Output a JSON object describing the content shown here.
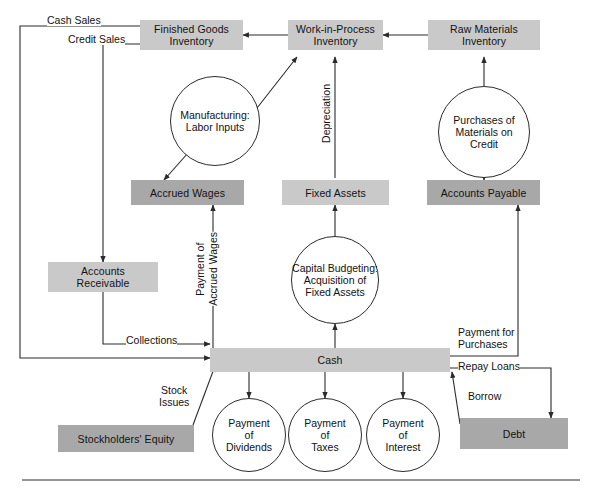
{
  "diagram": {
    "colors": {
      "asset_fill": "#c9c9c9",
      "liability_fill": "#a8a8a8",
      "line": "#2b2b2b",
      "background": "#ffffff"
    },
    "boxes": [
      {
        "id": "finished-goods-inventory",
        "label": "Finished Goods\nInventory",
        "shade": "light"
      },
      {
        "id": "work-in-process-inventory",
        "label": "Work-in-Process\nInventory",
        "shade": "light"
      },
      {
        "id": "raw-materials-inventory",
        "label": "Raw Materials\nInventory",
        "shade": "light"
      },
      {
        "id": "accrued-wages",
        "label": "Accrued Wages",
        "shade": "dark"
      },
      {
        "id": "fixed-assets",
        "label": "Fixed Assets",
        "shade": "light"
      },
      {
        "id": "accounts-payable",
        "label": "Accounts Payable",
        "shade": "dark"
      },
      {
        "id": "accounts-receivable",
        "label": "Accounts\nReceivable",
        "shade": "light"
      },
      {
        "id": "cash",
        "label": "Cash",
        "shade": "light"
      },
      {
        "id": "stockholders-equity",
        "label": "Stockholders' Equity",
        "shade": "dark"
      },
      {
        "id": "debt",
        "label": "Debt",
        "shade": "dark"
      }
    ],
    "circles": [
      {
        "id": "manufacturing-labor-inputs",
        "label": "Manufacturing:\nLabor Inputs"
      },
      {
        "id": "purchases-of-materials-on-credit",
        "label": "Purchases of\nMaterials on\nCredit"
      },
      {
        "id": "capital-budgeting",
        "label": "Capital Budgeting:\nAcquisition of\nFixed Assets"
      },
      {
        "id": "payment-of-dividends",
        "label": "Payment\nof\nDividends"
      },
      {
        "id": "payment-of-taxes",
        "label": "Payment\nof\nTaxes"
      },
      {
        "id": "payment-of-interest",
        "label": "Payment\nof\nInterest"
      }
    ],
    "edge_labels": [
      {
        "id": "cash-sales",
        "label": "Cash Sales"
      },
      {
        "id": "credit-sales",
        "label": "Credit Sales"
      },
      {
        "id": "depreciation",
        "label": "Depreciation"
      },
      {
        "id": "payment-of-accrued-wages",
        "label": "Payment of\nAccrued Wages"
      },
      {
        "id": "collections",
        "label": "Collections"
      },
      {
        "id": "stock-issues",
        "label": "Stock\nIssues"
      },
      {
        "id": "payment-for-purchases",
        "label": "Payment for\nPurchases"
      },
      {
        "id": "repay-loans",
        "label": "Repay Loans"
      },
      {
        "id": "borrow",
        "label": "Borrow"
      }
    ]
  }
}
